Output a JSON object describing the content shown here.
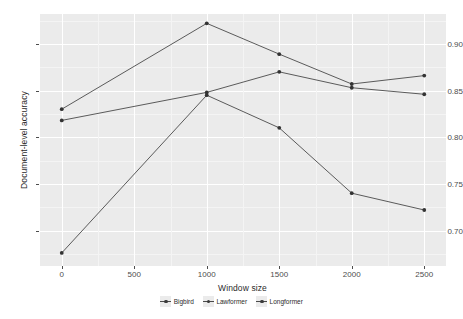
{
  "chart_data": {
    "type": "line",
    "title": "",
    "xlabel": "Window size",
    "ylabel": "Document-level accuracy",
    "x": [
      0,
      1000,
      1500,
      2000,
      2500
    ],
    "xlim": [
      -150,
      2650
    ],
    "ylim": [
      0.662,
      0.932
    ],
    "xticks": [
      "0",
      "500",
      "1000",
      "1500",
      "2000",
      "2500"
    ],
    "xtick_values": [
      0,
      500,
      1000,
      1500,
      2000,
      2500
    ],
    "yticks": [
      "0.70",
      "0.75",
      "0.80",
      "0.85",
      "0.90"
    ],
    "ytick_values": [
      0.7,
      0.75,
      0.8,
      0.85,
      0.9
    ],
    "grid": true,
    "legend_position": "bottom",
    "legend_title": "Window size",
    "series": [
      {
        "name": "Bigbird",
        "color": "#4a4a4a",
        "values": [
          0.83,
          0.922,
          0.889,
          0.857,
          0.866
        ]
      },
      {
        "name": "Lawformer",
        "color": "#4a4a4a",
        "values": [
          0.818,
          0.848,
          0.87,
          0.853,
          0.846
        ]
      },
      {
        "name": "Longformer",
        "color": "#4a4a4a",
        "values": [
          0.676,
          0.845,
          0.81,
          0.74,
          0.722
        ]
      }
    ]
  },
  "style": {
    "panel_background": "#ebebeb",
    "grid_color": "#ffffff",
    "line_color": "#4a4a4a",
    "point_color": "#333333",
    "text_color": "#2b2b2b",
    "tick_color": "#4d4d4d"
  }
}
